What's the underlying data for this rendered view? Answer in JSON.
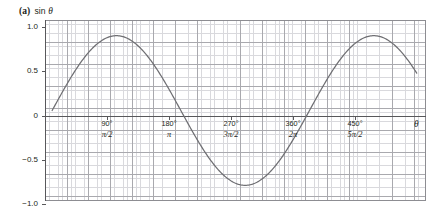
{
  "caption": {
    "tag": "(a)",
    "title_prefix": "sin ",
    "title_symbol": "θ"
  },
  "axis": {
    "x_axis_symbol": "θ",
    "y_ticks": [
      "1.0",
      "0.5",
      "0",
      "−0.5",
      "−1.0"
    ],
    "x_ticks": [
      {
        "deg": "90°",
        "rad": "π/2"
      },
      {
        "deg": "180°",
        "rad": "π"
      },
      {
        "deg": "270°",
        "rad": "3π/2"
      },
      {
        "deg": "360°",
        "rad": "2π"
      },
      {
        "deg": "450°",
        "rad": "5π/2"
      }
    ]
  },
  "colors": {
    "curve": "#6f6f73",
    "axis": "#58585b",
    "grid_minor": "#d9d9dd",
    "grid_major": "#a9a9ae",
    "background": "#ffffff",
    "text": "#231f20"
  },
  "chart_data": {
    "type": "line",
    "xlabel": "θ",
    "ylabel": "sin θ",
    "grid": true,
    "legend": null,
    "xlim_deg": [
      -10,
      523
    ],
    "ylim": [
      -1.21,
      1.21
    ],
    "x_tick_values_deg": [
      90,
      180,
      270,
      360,
      450
    ],
    "x_tick_labels_deg": [
      "90°",
      "180°",
      "270°",
      "360°",
      "450°"
    ],
    "x_tick_labels_rad": [
      "π/2",
      "π",
      "3π/2",
      "2π",
      "5π/2"
    ],
    "y_tick_values": [
      1.0,
      0.5,
      0,
      -0.5,
      -1.0
    ],
    "y_tick_labels": [
      "1.0",
      "0.5",
      "0",
      "−0.5",
      "−1.0"
    ],
    "series": [
      {
        "name": "sin θ",
        "x_deg": [
          0,
          15,
          30,
          45,
          60,
          75,
          90,
          105,
          120,
          135,
          150,
          165,
          180,
          195,
          210,
          225,
          240,
          255,
          270,
          285,
          300,
          315,
          330,
          345,
          360,
          375,
          390,
          405,
          420,
          435,
          450,
          465,
          480,
          495,
          510
        ],
        "values": [
          0,
          0.259,
          0.5,
          0.707,
          0.866,
          0.966,
          1,
          0.966,
          0.866,
          0.707,
          0.5,
          0.259,
          0,
          -0.259,
          -0.5,
          -0.707,
          -0.866,
          -0.966,
          -1,
          -0.966,
          -0.866,
          -0.707,
          -0.5,
          -0.259,
          0,
          0.259,
          0.5,
          0.707,
          0.866,
          0.966,
          1,
          0.966,
          0.866,
          0.707,
          0.5
        ]
      }
    ],
    "annotations": [
      {
        "text": "maximum 1.0 at 90° and 450°"
      },
      {
        "text": "minimum −1.0 at 270°"
      },
      {
        "text": "zeros at 0°, 180°, 360°"
      }
    ]
  }
}
